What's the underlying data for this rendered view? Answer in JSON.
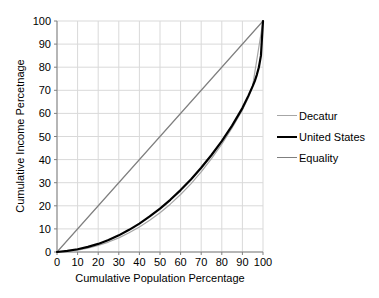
{
  "chart_data": {
    "type": "line",
    "title": "",
    "xlabel": "Cumulative Population Percentage",
    "ylabel": "Cumulative Income Percetnage",
    "xlim": [
      0,
      100
    ],
    "ylim": [
      0,
      100
    ],
    "xticks": [
      0,
      10,
      20,
      30,
      40,
      50,
      60,
      70,
      80,
      90,
      100
    ],
    "yticks": [
      0,
      10,
      20,
      30,
      40,
      50,
      60,
      70,
      80,
      90,
      100
    ],
    "grid": true,
    "grid_color": "#d9d9d9",
    "axis_color": "#808080",
    "text_color": "#000000",
    "background_color": "#ffffff",
    "legend_position": "right",
    "series": [
      {
        "name": "Decatur",
        "color": "#a6a6a6",
        "line_width": 1.2,
        "points": [
          [
            0,
            0
          ],
          [
            5,
            0.3
          ],
          [
            10,
            0.8
          ],
          [
            15,
            1.7
          ],
          [
            20,
            2.8
          ],
          [
            25,
            4.3
          ],
          [
            30,
            6.1
          ],
          [
            35,
            8.3
          ],
          [
            40,
            10.8
          ],
          [
            45,
            13.7
          ],
          [
            50,
            17.0
          ],
          [
            55,
            20.7
          ],
          [
            60,
            24.9
          ],
          [
            65,
            29.5
          ],
          [
            70,
            34.7
          ],
          [
            75,
            40.4
          ],
          [
            80,
            46.7
          ],
          [
            85,
            53.7
          ],
          [
            90,
            61.5
          ],
          [
            93,
            67.0
          ],
          [
            95,
            72.0
          ],
          [
            100,
            100
          ]
        ]
      },
      {
        "name": "United States",
        "color": "#000000",
        "line_width": 2.2,
        "points": [
          [
            0,
            0
          ],
          [
            5,
            0.5
          ],
          [
            10,
            1.2
          ],
          [
            15,
            2.2
          ],
          [
            20,
            3.5
          ],
          [
            25,
            5.2
          ],
          [
            30,
            7.2
          ],
          [
            35,
            9.6
          ],
          [
            40,
            12.3
          ],
          [
            45,
            15.4
          ],
          [
            50,
            18.8
          ],
          [
            55,
            22.6
          ],
          [
            60,
            26.8
          ],
          [
            65,
            31.4
          ],
          [
            70,
            36.5
          ],
          [
            75,
            42.0
          ],
          [
            80,
            48.0
          ],
          [
            85,
            54.7
          ],
          [
            90,
            62.3
          ],
          [
            93,
            67.8
          ],
          [
            95,
            71.8
          ],
          [
            96,
            74.0
          ],
          [
            97,
            76.7
          ],
          [
            98,
            80.0
          ],
          [
            99,
            85.0
          ],
          [
            100,
            100
          ]
        ]
      },
      {
        "name": "Equality",
        "color": "#7f7f7f",
        "line_width": 1.2,
        "points": [
          [
            0,
            0
          ],
          [
            100,
            100
          ]
        ]
      }
    ]
  }
}
